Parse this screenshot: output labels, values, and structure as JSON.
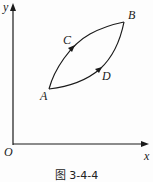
{
  "figure": {
    "caption": "图 3-4-4",
    "axes": {
      "x_label": "x",
      "y_label": "y",
      "origin_label": "O"
    },
    "points": {
      "A": "A",
      "B": "B",
      "C": "C",
      "D": "D"
    },
    "paths": [
      {
        "name": "ACB",
        "from": "A",
        "via": "C",
        "to": "B",
        "arrow_direction": "A to B"
      },
      {
        "name": "ADB",
        "from": "A",
        "via": "D",
        "to": "B",
        "arrow_direction": "A to B"
      }
    ],
    "colors": {
      "stroke": "#1a1a1a",
      "background": "#fdfdfd"
    }
  }
}
